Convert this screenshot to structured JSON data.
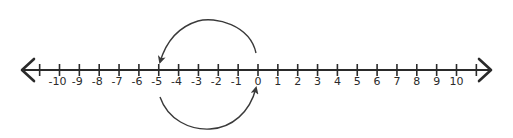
{
  "diagram": {
    "type": "number-line",
    "min": -10,
    "max": 10,
    "step": 1,
    "labels": [
      "-10",
      "-9",
      "-8",
      "-7",
      "-6",
      "-5",
      "-4",
      "-3",
      "-2",
      "-1",
      "0",
      "1",
      "2",
      "3",
      "4",
      "5",
      "6",
      "7",
      "8",
      "9",
      "10"
    ],
    "arrows": [
      {
        "name": "top-arc",
        "from": 0,
        "to": -5,
        "position": "above"
      },
      {
        "name": "bottom-arc",
        "from": -5,
        "to": 0,
        "position": "below"
      }
    ],
    "colors": {
      "line": "#2a2a2a",
      "arc": "#3a3a3a",
      "background": "#ffffff"
    }
  }
}
